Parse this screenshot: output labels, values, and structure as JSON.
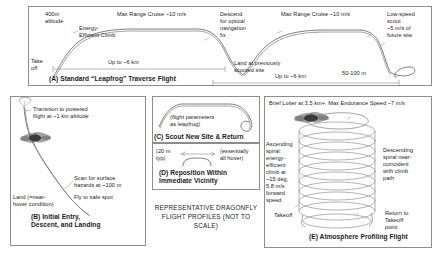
{
  "figure": {
    "caption": "REPRESENTATIVE\nDRAGONFLY FLIGHT\nPROFILES (NOT TO SCALE)"
  },
  "panel_a": {
    "title": "(A) Standard “Leapfrog” Traverse Flight",
    "labels": {
      "altitude": "400m\naltitude",
      "takeoff": "Take\noff",
      "climb": "Energy-\nEfficient Climb",
      "cruise1": "Max Range Cruise ~10 m/s",
      "descend": "Descend\nfor optical\nnavigation\nfix",
      "cruise2": "Max Range Cruise ~10 m/s",
      "scout": "Low-speed\nscout\n~5 m/s of\nfuture site",
      "range1": "Up to ~6 km",
      "land": "Land at previously\nscouted site",
      "hop": "50-100 m",
      "range2": "Up to ~6 km"
    }
  },
  "panel_b": {
    "title": "(B) Initial Entry,\nDescent, and Landing",
    "labels": {
      "transition": "Transition to powered\nflight at ~1 km altitude",
      "scan": "Scan for surface\nhazards at ~100 m",
      "fly": "Fly to safe spot",
      "land": "Land (=near-\nhover condition)"
    }
  },
  "panel_c": {
    "title": "(C) Scout New Site & Return",
    "labels": {
      "params": "(flight parameters\nas leapfrog)"
    }
  },
  "panel_d": {
    "title": "(D) Reposition Within\nImmediate Vicinity",
    "labels": {
      "distance": "(20 m\ntyp)",
      "hover": "(essentially\nall hover)"
    }
  },
  "panel_e": {
    "title": "(E) Atmosphere Profiling Flight",
    "labels": {
      "loiter": "Brief Loiter at 3.5 km+, Max Endurance Speed ~7 m/s",
      "ascend": "Ascending\nspiral:\nenergy-\nefficient\nclimb at\n~15 deg,\n5.8 m/s\nforward\nspeed",
      "descend": "Descending\nspiral near-\ncoincident\nwith climb\npath",
      "takeoff": "Takeoff",
      "return": "Return to\nTakeoff\npoint"
    }
  },
  "colors": {
    "stroke": "#6f6f6f",
    "border": "#8d8d8d",
    "text": "#1b1b1b"
  }
}
